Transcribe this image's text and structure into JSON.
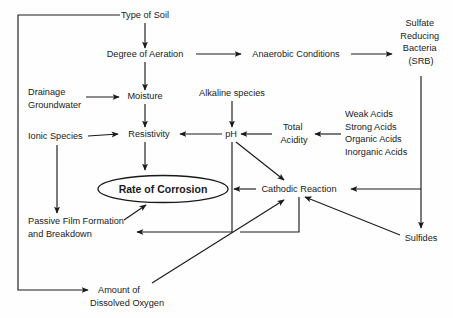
{
  "diagram": {
    "background_color": "#fefefe",
    "line_color": "#1a1a1a",
    "text_color": "#1a1a1a",
    "nodes": {
      "type_of_soil": {
        "label": "Type of Soil",
        "x": 145,
        "y": 18
      },
      "degree_of_aeration": {
        "label": "Degree of Aeration",
        "x": 145,
        "y": 57
      },
      "anaerobic_conditions": {
        "label": "Anaerobic Conditions",
        "x": 296,
        "y": 57
      },
      "sulfate_reducing_bacteria": {
        "lines": [
          "Sulfate",
          "Reducing",
          "Bacteria",
          "(SRB)"
        ],
        "x": 421,
        "y": 26
      },
      "drainage_groundwater": {
        "lines": [
          "Drainage",
          "Groundwater"
        ],
        "x": 28,
        "y": 95
      },
      "moisture": {
        "label": "Moisture",
        "x": 145,
        "y": 99
      },
      "alkaline_species": {
        "label": "Alkaline species",
        "x": 232,
        "y": 96
      },
      "ionic_species": {
        "label": "Ionic Species",
        "x": 28,
        "y": 139
      },
      "resistivity": {
        "label": "Resistivity",
        "x": 145,
        "y": 136
      },
      "ph": {
        "label": "pH",
        "x": 229,
        "y": 136
      },
      "total_acidity": {
        "lines": [
          "Total",
          "Acidity"
        ],
        "x": 295,
        "y": 130
      },
      "acids": {
        "lines": [
          "Weak Acids",
          "Strong Acids",
          "Organic Acids",
          "Inorganic Acids"
        ],
        "x": 345,
        "y": 117
      },
      "rate_of_corrosion": {
        "label": "Rate of Corrosion",
        "x": 163,
        "y": 189
      },
      "cathodic_reaction": {
        "label": "Cathodic Reaction",
        "x": 299,
        "y": 192
      },
      "sulfides": {
        "label": "Sulfides",
        "x": 421,
        "y": 241
      },
      "passive_film": {
        "lines": [
          "Passive Film Formation",
          "and Breakdown"
        ],
        "x": 28,
        "y": 224
      },
      "dissolved_oxygen": {
        "lines": [
          "Amount of",
          "Dissolved Oxygen"
        ],
        "x": 98,
        "y": 290
      }
    },
    "edges": [
      {
        "from": "type_of_soil",
        "to": "degree_of_aeration"
      },
      {
        "from": "degree_of_aeration",
        "to": "anaerobic_conditions"
      },
      {
        "from": "anaerobic_conditions",
        "to": "sulfate_reducing_bacteria"
      },
      {
        "from": "degree_of_aeration",
        "to": "moisture"
      },
      {
        "from": "drainage_groundwater",
        "to": "moisture"
      },
      {
        "from": "moisture",
        "to": "resistivity"
      },
      {
        "from": "alkaline_species",
        "to": "ph"
      },
      {
        "from": "ionic_species",
        "to": "resistivity"
      },
      {
        "from": "ph",
        "to": "resistivity"
      },
      {
        "from": "total_acidity",
        "to": "ph"
      },
      {
        "from": "acids",
        "to": "total_acidity"
      },
      {
        "from": "resistivity",
        "to": "rate_of_corrosion"
      },
      {
        "from": "ph",
        "to": "cathodic_reaction"
      },
      {
        "from": "cathodic_reaction",
        "to": "rate_of_corrosion"
      },
      {
        "from": "sulfate_reducing_bacteria",
        "to": "sulfides"
      },
      {
        "from": "sulfate_reducing_bacteria",
        "to": "cathodic_reaction"
      },
      {
        "from": "sulfides",
        "to": "cathodic_reaction"
      },
      {
        "from": "ionic_species",
        "to": "passive_film"
      },
      {
        "from": "passive_film",
        "to": "rate_of_corrosion"
      },
      {
        "from": "ph",
        "to": "passive_film"
      },
      {
        "from": "cathodic_reaction",
        "to": "passive_film"
      },
      {
        "from": "type_of_soil",
        "to": "dissolved_oxygen"
      },
      {
        "from": "dissolved_oxygen",
        "to": "cathodic_reaction"
      }
    ]
  }
}
